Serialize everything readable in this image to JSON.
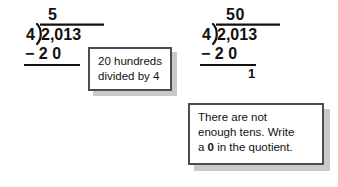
{
  "page": {
    "background_color": "#ffffff",
    "text_color": "#111111"
  },
  "problems": [
    {
      "name": "step-one",
      "quotient": "5",
      "divisor": "4",
      "dividend": "2,013",
      "subtrahend": "− 2 0",
      "remainder": ""
    },
    {
      "name": "step-two",
      "quotient": "50",
      "divisor": "4",
      "dividend": "2,013",
      "subtrahend": "− 2 0",
      "remainder": "1"
    }
  ],
  "callouts": [
    {
      "name": "callout-hundreds",
      "lines": [
        "20 hundreds",
        "divided by 4"
      ],
      "border_color": "#4d4d4d",
      "shadow_color": "#c9c9c9",
      "fill_color": "#ffffff"
    },
    {
      "name": "callout-tens",
      "line1": "There are not",
      "line2": "enough tens. Write",
      "line3_pre": "a ",
      "line3_bold": "0",
      "line3_post": " in the quotient.",
      "border_color": "#4d4d4d",
      "shadow_color": "#c9c9c9",
      "fill_color": "#ffffff"
    }
  ]
}
